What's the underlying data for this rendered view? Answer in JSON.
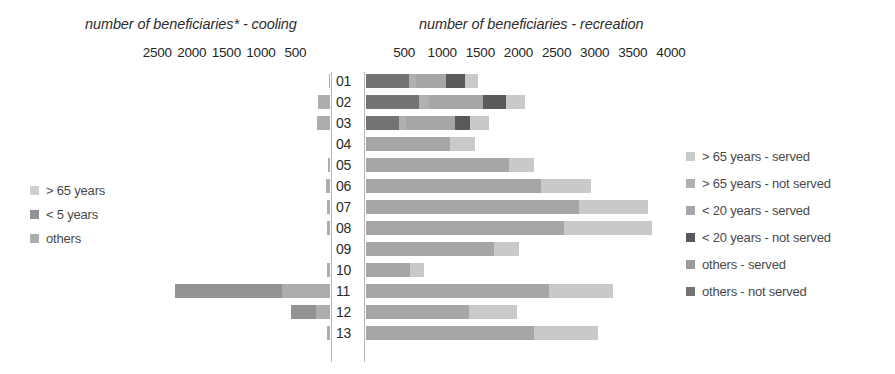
{
  "titles": {
    "left": "number of beneficiaries* - cooling",
    "right": "number of beneficiaries - recreation"
  },
  "axes": {
    "left": {
      "ticks": [
        "2500",
        "2000",
        "1500",
        "1000",
        "500"
      ],
      "tick_values": [
        2500,
        2000,
        1500,
        1000,
        500
      ],
      "max": 2750,
      "direction": "right-to-left"
    },
    "right": {
      "ticks": [
        "500",
        "1000",
        "1500",
        "2000",
        "2500",
        "3000",
        "3500",
        "4000"
      ],
      "tick_values": [
        500,
        1000,
        1500,
        2000,
        2500,
        3000,
        3500,
        4000
      ],
      "max": 4250,
      "direction": "left-to-right"
    }
  },
  "legend_left": {
    "items": [
      {
        "label": "> 65 years",
        "color": "#cfcfcf"
      },
      {
        "label": "< 5 years",
        "color": "#939393"
      },
      {
        "label": "others",
        "color": "#adadad"
      }
    ]
  },
  "legend_right": {
    "items": [
      {
        "label": "> 65 years - served",
        "color": "#c9c9c9"
      },
      {
        "label": "> 65 years - not served",
        "color": "#b0b0b0"
      },
      {
        "label": "< 20 years - served",
        "color": "#a6a6a6"
      },
      {
        "label": "< 20 years - not served",
        "color": "#5a5a5a"
      },
      {
        "label": "others - served",
        "color": "#9b9b9b"
      },
      {
        "label": "others - not served",
        "color": "#737373"
      }
    ]
  },
  "chart_data": {
    "type": "bar",
    "orientation": "horizontal",
    "subtype": "stacked diverging (back-to-back) bar chart",
    "categories": [
      "01",
      "02",
      "03",
      "04",
      "05",
      "06",
      "07",
      "08",
      "09",
      "10",
      "11",
      "12",
      "13"
    ],
    "panels": [
      {
        "name": "cooling",
        "title": "number of beneficiaries* - cooling",
        "side": "left",
        "xlabel": "number of beneficiaries",
        "xlim": [
          0,
          2750
        ],
        "ticks": [
          2500,
          2000,
          1500,
          1000,
          500
        ],
        "series": [
          {
            "name": "others",
            "color": "#adadad",
            "values": [
              20,
              180,
              190,
              0,
              35,
              60,
              45,
              50,
              0,
              40,
              700,
              200,
              40
            ]
          },
          {
            "name": "< 5 years",
            "color": "#939393",
            "values": [
              0,
              0,
              0,
              0,
              0,
              0,
              0,
              0,
              0,
              0,
              1550,
              370,
              0
            ]
          },
          {
            "name": "> 65 years",
            "color": "#cfcfcf",
            "values": [
              0,
              0,
              0,
              0,
              0,
              0,
              0,
              0,
              0,
              0,
              0,
              0,
              0
            ]
          }
        ],
        "totals": [
          20,
          180,
          190,
          0,
          35,
          60,
          45,
          50,
          0,
          40,
          2250,
          570,
          40
        ]
      },
      {
        "name": "recreation",
        "title": "number of beneficiaries - recreation",
        "side": "right",
        "xlabel": "number of beneficiaries",
        "xlim": [
          0,
          4250
        ],
        "ticks": [
          500,
          1000,
          1500,
          2000,
          2500,
          3000,
          3500,
          4000
        ],
        "series": [
          {
            "name": "others - not served",
            "color": "#737373",
            "values": [
              560,
              700,
              430,
              0,
              0,
              0,
              0,
              0,
              0,
              0,
              0,
              0,
              0
            ]
          },
          {
            "name": "others - served",
            "color": "#9b9b9b",
            "values": [
              0,
              0,
              0,
              0,
              0,
              0,
              0,
              0,
              0,
              0,
              0,
              0,
              0
            ]
          },
          {
            "name": "< 20 years - not served",
            "color": "#5a5a5a",
            "values": [
              250,
              300,
              190,
              0,
              0,
              0,
              0,
              0,
              0,
              0,
              0,
              0,
              0
            ]
          },
          {
            "name": "< 20 years - served",
            "color": "#a6a6a6",
            "values": [
              400,
              720,
              650,
              1100,
              1880,
              2300,
              2800,
              2600,
              1680,
              580,
              2400,
              1350,
              2200
            ]
          },
          {
            "name": "> 65 years - not served",
            "color": "#b0b0b0",
            "values": [
              90,
              120,
              90,
              0,
              0,
              0,
              0,
              0,
              0,
              0,
              0,
              0,
              0
            ]
          },
          {
            "name": "> 65 years - served",
            "color": "#c9c9c9",
            "values": [
              170,
              240,
              260,
              330,
              330,
              650,
              900,
              1150,
              330,
              180,
              840,
              630,
              840
            ]
          }
        ],
        "totals": [
          1470,
          2080,
          1620,
          1430,
          2210,
          2950,
          3700,
          3750,
          2010,
          760,
          3240,
          1980,
          3040
        ]
      }
    ],
    "bars": [
      {
        "category": "01",
        "left": [
          {
            "series": "others",
            "value": 20
          }
        ],
        "right": [
          {
            "series": "others - not served",
            "value": 560
          },
          {
            "series": "> 65 years - not served",
            "value": 90
          },
          {
            "series": "< 20 years - served",
            "value": 400
          },
          {
            "series": "< 20 years - not served",
            "value": 250
          },
          {
            "series": "> 65 years - served",
            "value": 170
          }
        ]
      },
      {
        "category": "02",
        "left": [
          {
            "series": "others",
            "value": 180
          }
        ],
        "right": [
          {
            "series": "others - not served",
            "value": 700
          },
          {
            "series": "> 65 years - not served",
            "value": 120
          },
          {
            "series": "< 20 years - served",
            "value": 720
          },
          {
            "series": "< 20 years - not served",
            "value": 300
          },
          {
            "series": "> 65 years - served",
            "value": 240
          }
        ]
      },
      {
        "category": "03",
        "left": [
          {
            "series": "others",
            "value": 190
          }
        ],
        "right": [
          {
            "series": "others - not served",
            "value": 430
          },
          {
            "series": "> 65 years - not served",
            "value": 90
          },
          {
            "series": "< 20 years - served",
            "value": 650
          },
          {
            "series": "< 20 years - not served",
            "value": 190
          },
          {
            "series": "> 65 years - served",
            "value": 260
          }
        ]
      },
      {
        "category": "04",
        "left": [],
        "right": [
          {
            "series": "< 20 years - served",
            "value": 1100
          },
          {
            "series": "> 65 years - served",
            "value": 330
          }
        ]
      },
      {
        "category": "05",
        "left": [
          {
            "series": "others",
            "value": 35
          }
        ],
        "right": [
          {
            "series": "< 20 years - served",
            "value": 1880
          },
          {
            "series": "> 65 years - served",
            "value": 330
          }
        ]
      },
      {
        "category": "06",
        "left": [
          {
            "series": "others",
            "value": 60
          }
        ],
        "right": [
          {
            "series": "< 20 years - served",
            "value": 2300
          },
          {
            "series": "> 65 years - served",
            "value": 650
          }
        ]
      },
      {
        "category": "07",
        "left": [
          {
            "series": "others",
            "value": 45
          }
        ],
        "right": [
          {
            "series": "< 20 years - served",
            "value": 2800
          },
          {
            "series": "> 65 years - served",
            "value": 900
          }
        ]
      },
      {
        "category": "08",
        "left": [
          {
            "series": "others",
            "value": 50
          }
        ],
        "right": [
          {
            "series": "< 20 years - served",
            "value": 2600
          },
          {
            "series": "> 65 years - served",
            "value": 1150
          }
        ]
      },
      {
        "category": "09",
        "left": [],
        "right": [
          {
            "series": "< 20 years - served",
            "value": 1680
          },
          {
            "series": "> 65 years - served",
            "value": 330
          }
        ]
      },
      {
        "category": "10",
        "left": [
          {
            "series": "others",
            "value": 40
          }
        ],
        "right": [
          {
            "series": "< 20 years - served",
            "value": 580
          },
          {
            "series": "> 65 years - served",
            "value": 180
          }
        ]
      },
      {
        "category": "11",
        "left": [
          {
            "series": "others",
            "value": 700
          },
          {
            "series": "< 5 years",
            "value": 1550
          }
        ],
        "right": [
          {
            "series": "< 20 years - served",
            "value": 2400
          },
          {
            "series": "> 65 years - served",
            "value": 840
          }
        ]
      },
      {
        "category": "12",
        "left": [
          {
            "series": "others",
            "value": 200
          },
          {
            "series": "< 5 years",
            "value": 370
          }
        ],
        "right": [
          {
            "series": "< 20 years - served",
            "value": 1350
          },
          {
            "series": "> 65 years - served",
            "value": 630
          }
        ]
      },
      {
        "category": "13",
        "left": [
          {
            "series": "others",
            "value": 40
          }
        ],
        "right": [
          {
            "series": "< 20 years - served",
            "value": 2200
          },
          {
            "series": "> 65 years - served",
            "value": 840
          }
        ]
      }
    ],
    "footnote_marker": "*",
    "grid": false,
    "legend_position": [
      "left-middle",
      "right-middle"
    ]
  },
  "layout": {
    "center_x": 334,
    "label_gutter": 30,
    "left_plot_right_edge": 330,
    "left_plot_left_edge": 140,
    "right_plot_left_edge": 366,
    "right_plot_right_edge": 690,
    "row_height": 21,
    "bar_height": 14,
    "plot_top": 72
  }
}
